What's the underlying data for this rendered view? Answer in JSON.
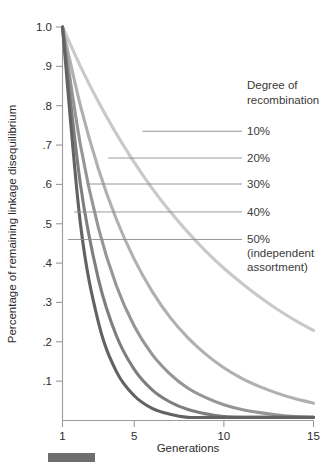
{
  "chart_data": {
    "type": "line",
    "title": "",
    "xlabel": "Generations",
    "ylabel": "Percentage of remaining linkage disequilibrium",
    "xlim": [
      1,
      15
    ],
    "ylim": [
      0,
      1.0
    ],
    "grid": false,
    "legend_position": "right",
    "legend_title": "Degree of recombination",
    "legend_title_line1": "Degree of",
    "legend_title_line2": "recombination",
    "legend_note_line1": "(independent",
    "legend_note_line2": "assortment)",
    "xticks": [
      1,
      5,
      10,
      15
    ],
    "xtick_labels": [
      "1",
      "5",
      "10",
      "15"
    ],
    "yticks": [
      1.0,
      0.9,
      0.8,
      0.7,
      0.6,
      0.5,
      0.4,
      0.3,
      0.2,
      0.1
    ],
    "ytick_labels": [
      "1.0",
      ".9",
      ".8",
      ".7",
      ".6",
      ".5",
      ".4",
      ".3",
      ".2",
      ".1"
    ],
    "x": [
      1,
      2,
      3,
      4,
      5,
      6,
      7,
      8,
      9,
      10,
      11,
      12,
      13,
      14,
      15
    ],
    "series": [
      {
        "name": "10%",
        "label": "10%",
        "recombination": 0.1,
        "color": "#c9c9c9",
        "values": [
          1.0,
          0.9,
          0.81,
          0.729,
          0.656,
          0.59,
          0.531,
          0.478,
          0.43,
          0.387,
          0.349,
          0.314,
          0.282,
          0.254,
          0.229
        ]
      },
      {
        "name": "20%",
        "label": "20%",
        "recombination": 0.2,
        "color": "#b0b0b0",
        "values": [
          1.0,
          0.8,
          0.64,
          0.512,
          0.41,
          0.328,
          0.262,
          0.21,
          0.168,
          0.134,
          0.107,
          0.086,
          0.069,
          0.055,
          0.044
        ]
      },
      {
        "name": "30%",
        "label": "30%",
        "recombination": 0.3,
        "color": "#969696",
        "values": [
          1.0,
          0.7,
          0.49,
          0.343,
          0.24,
          0.168,
          0.118,
          0.082,
          0.058,
          0.04,
          0.028,
          0.02,
          0.014,
          0.01,
          0.007
        ]
      },
      {
        "name": "40%",
        "label": "40%",
        "recombination": 0.4,
        "color": "#7e7e7e",
        "values": [
          1.0,
          0.6,
          0.36,
          0.216,
          0.13,
          0.078,
          0.047,
          0.028,
          0.017,
          0.01,
          0.006,
          0.004,
          0.002,
          0.001,
          0.001
        ]
      },
      {
        "name": "50%",
        "label": "50%",
        "recombination": 0.5,
        "color": "#626262",
        "values": [
          1.0,
          0.5,
          0.25,
          0.125,
          0.063,
          0.031,
          0.016,
          0.008,
          0.004,
          0.002,
          0.001,
          0.0005,
          0.0002,
          0.0001,
          0.0001
        ]
      }
    ],
    "legend_entries": [
      {
        "label": "10%",
        "leader_y": 0.735,
        "leader_x_start": 5.45
      },
      {
        "label": "20%",
        "leader_y": 0.667,
        "leader_x_start": 3.55
      },
      {
        "label": "30%",
        "leader_y": 0.601,
        "leader_x_start": 2.35
      },
      {
        "label": "40%",
        "leader_y": 0.53,
        "leader_x_start": 1.65
      },
      {
        "label": "50%",
        "leader_y": 0.46,
        "leader_x_start": 1.3
      }
    ]
  },
  "footer": {
    "bar_label": "figure-marker-bar"
  }
}
